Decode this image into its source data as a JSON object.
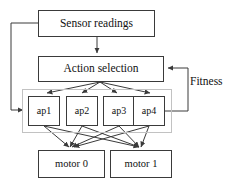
{
  "diagram": {
    "type": "flowchart",
    "canvas": {
      "width": 236,
      "height": 183,
      "background": "#ffffff"
    },
    "style": {
      "node_border_color": "#3a3a3a",
      "group_border_color": "#c2c2c2",
      "wire_color": "#3a3a3a",
      "text_color": "#111111"
    },
    "nodes": [
      {
        "id": "sensor",
        "label": "Sensor readings",
        "x": 38,
        "y": 10,
        "w": 117,
        "h": 27
      },
      {
        "id": "action",
        "label": "Action selection",
        "x": 38,
        "y": 56,
        "w": 126,
        "h": 26
      },
      {
        "id": "ap1",
        "label": "ap1",
        "x": 28,
        "y": 96,
        "w": 32,
        "h": 30
      },
      {
        "id": "ap2",
        "label": "ap2",
        "x": 66,
        "y": 96,
        "w": 32,
        "h": 30
      },
      {
        "id": "ap3",
        "label": "ap3",
        "x": 103,
        "y": 96,
        "w": 32,
        "h": 30
      },
      {
        "id": "ap4",
        "label": "ap4",
        "x": 133,
        "y": 96,
        "w": 32,
        "h": 30
      },
      {
        "id": "motor0",
        "label": "motor 0",
        "x": 38,
        "y": 150,
        "w": 67,
        "h": 28
      },
      {
        "id": "motor1",
        "label": "motor 1",
        "x": 110,
        "y": 150,
        "w": 62,
        "h": 28
      }
    ],
    "groups": [
      {
        "id": "ap-group",
        "label": "",
        "x": 22,
        "y": 89,
        "w": 150,
        "h": 44
      }
    ],
    "labels": [
      {
        "id": "fitness",
        "text": "Fitness",
        "x": 190,
        "y": 76
      }
    ],
    "edges": [
      {
        "from": "sensor",
        "to": "action",
        "kind": "arrow-down"
      },
      {
        "from": "sensor",
        "to": "ap-group",
        "kind": "feedback-left"
      },
      {
        "from": "action",
        "to": "ap1",
        "kind": "arrow-fan"
      },
      {
        "from": "action",
        "to": "ap2",
        "kind": "arrow-fan"
      },
      {
        "from": "action",
        "to": "ap3",
        "kind": "arrow-fan"
      },
      {
        "from": "action",
        "to": "ap4",
        "kind": "arrow-fan"
      },
      {
        "from": "ap4",
        "to": "action",
        "kind": "feedback-right",
        "label": "Fitness"
      },
      {
        "from": "ap1",
        "to": "motor0",
        "kind": "arrow"
      },
      {
        "from": "ap1",
        "to": "motor1",
        "kind": "arrow"
      },
      {
        "from": "ap2",
        "to": "motor0",
        "kind": "arrow"
      },
      {
        "from": "ap2",
        "to": "motor1",
        "kind": "arrow"
      },
      {
        "from": "ap3",
        "to": "motor0",
        "kind": "arrow"
      },
      {
        "from": "ap3",
        "to": "motor1",
        "kind": "arrow"
      },
      {
        "from": "ap4",
        "to": "motor0",
        "kind": "arrow"
      },
      {
        "from": "ap4",
        "to": "motor1",
        "kind": "arrow"
      }
    ]
  }
}
